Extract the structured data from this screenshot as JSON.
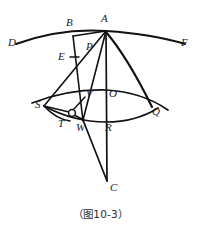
{
  "figure": {
    "caption": "（图10-3）",
    "caption_label": "图10-3",
    "stroke_color": "#111111",
    "background_color": "#ffffff"
  },
  "labels": {
    "D": "D",
    "B": "B",
    "A": "A",
    "F": "F",
    "P": "P",
    "E": "E",
    "S": "S",
    "V": "V",
    "O": "O",
    "Q": "Q",
    "T": "T",
    "W": "W",
    "R": "R",
    "C": "C"
  },
  "points": [
    {
      "id": "D",
      "label": "D",
      "x": 16,
      "y": 44,
      "label_x": 10,
      "label_y": 38
    },
    {
      "id": "B",
      "label": "B",
      "x": 73,
      "y": 36,
      "label_x": 66,
      "label_y": 20
    },
    {
      "id": "A",
      "label": "A",
      "x": 106,
      "y": 31,
      "label_x": 101,
      "label_y": 15
    },
    {
      "id": "F",
      "label": "F",
      "x": 185,
      "y": 44,
      "label_x": 181,
      "label_y": 38
    },
    {
      "id": "P",
      "label": "P",
      "x": 92,
      "y": 52,
      "label_x": 86,
      "label_y": 43
    },
    {
      "id": "E",
      "label": "E",
      "x": 72,
      "y": 60,
      "label_x": 60,
      "label_y": 55
    },
    {
      "id": "S",
      "label": "S",
      "x": 44,
      "y": 106,
      "label_x": 39,
      "label_y": 101
    },
    {
      "id": "V",
      "label": "V",
      "x": 84,
      "y": 97,
      "label_x": 85,
      "label_y": 92
    },
    {
      "id": "O",
      "label": "O",
      "x": 106,
      "y": 96,
      "label_x": 107,
      "label_y": 91
    },
    {
      "id": "Q",
      "label": "Q",
      "x": 152,
      "y": 107,
      "label_x": 152,
      "label_y": 105
    },
    {
      "id": "T",
      "label": "T",
      "x": 68,
      "y": 121,
      "label_x": 60,
      "label_y": 119
    },
    {
      "id": "W",
      "label": "W",
      "x": 83,
      "y": 120,
      "label_x": 78,
      "label_y": 120
    },
    {
      "id": "R",
      "label": "R",
      "x": 106,
      "y": 119,
      "label_x": 104,
      "label_y": 119
    },
    {
      "id": "C",
      "label": "C",
      "x": 107,
      "y": 183,
      "label_x": 107,
      "label_y": 178
    }
  ],
  "segments": [
    {
      "name": "segment-B-A",
      "from": "B",
      "to": "A"
    },
    {
      "name": "segment-B-W",
      "from": "B",
      "to": "W"
    },
    {
      "name": "segment-A-P",
      "from": "A",
      "to": "P"
    },
    {
      "name": "segment-A-S",
      "from": "A",
      "to": "S"
    },
    {
      "name": "segment-A-C",
      "from": "A",
      "to": "C"
    },
    {
      "name": "segment-A-W",
      "from": "A",
      "to": "W"
    },
    {
      "name": "segment-S-circle",
      "from": "S",
      "to": "small-circle"
    },
    {
      "name": "segment-circle-V",
      "from": "small-circle",
      "to": "V"
    },
    {
      "name": "segment-circle-W",
      "from": "small-circle",
      "to": "W"
    }
  ],
  "arcs": [
    {
      "name": "arc-D-B-A-F",
      "description": "upper arc through D, B, A, F"
    },
    {
      "name": "arc-A-Q",
      "description": "curve from A down to Q"
    },
    {
      "name": "arc-S-O-Q",
      "description": "upper lens arc from S through O to Q"
    },
    {
      "name": "arc-S-R-Q",
      "description": "lower lens arc from S through R to Q"
    },
    {
      "name": "arc-S-T-W",
      "description": "small arc from S through T toward W"
    }
  ],
  "marks": [
    {
      "name": "tick-mark-E",
      "description": "single tick mark on segment BW near E"
    },
    {
      "name": "small-circle-node",
      "description": "small open circle node between S, T and W",
      "x": 72,
      "y": 113,
      "r": 3.4
    }
  ]
}
